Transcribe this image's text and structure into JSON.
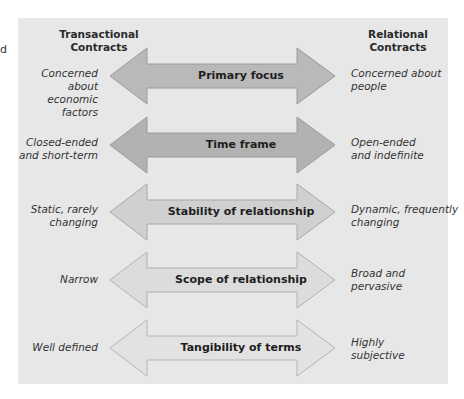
{
  "stray_char": "d",
  "columns": {
    "left_title_line1": "Transactional",
    "left_title_line2": "Contracts",
    "right_title_line1": "Relational",
    "right_title_line2": "Contracts"
  },
  "rows": [
    {
      "label": "Primary focus",
      "left_line1": "Concerned about",
      "left_line2": "economic factors",
      "right_line1": "Concerned about",
      "right_line2": "people",
      "fill": "#b9b9b9"
    },
    {
      "label": "Time frame",
      "left_line1": "Closed-ended",
      "left_line2": "and short-term",
      "right_line1": "Open-ended",
      "right_line2": "and indefinite",
      "fill": "#b2b2b2"
    },
    {
      "label": "Stability of relationship",
      "left_line1": "Static, rarely",
      "left_line2": "changing",
      "right_line1": "Dynamic, frequently",
      "right_line2": "changing",
      "fill": "#d0d0d0"
    },
    {
      "label": "Scope of relationship",
      "left_line1": "Narrow",
      "left_line2": "",
      "right_line1": "Broad and",
      "right_line2": "pervasive",
      "fill": "#dcdcdc"
    },
    {
      "label": "Tangibility of terms",
      "left_line1": "Well defined",
      "left_line2": "",
      "right_line1": "Highly",
      "right_line2": "subjective",
      "fill": "#e2e2e2"
    }
  ]
}
